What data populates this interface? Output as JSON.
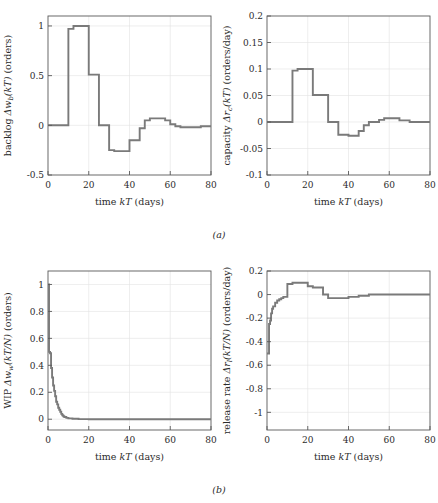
{
  "figure": {
    "captions": [
      {
        "id": "a",
        "text": "(a)"
      },
      {
        "id": "b",
        "text": "(b)"
      }
    ],
    "line_color": "#7a7a7a",
    "axis_color": "#595959",
    "grid_color": "#e2e2e2",
    "background": "#ffffff"
  },
  "chart_data": [
    {
      "id": "backlog",
      "type": "line",
      "drawstyle": "steps-post",
      "position": "top-left",
      "title": "",
      "xlabel": "time kT (days)",
      "xlabel_parts": {
        "pre": "time ",
        "italic": "kT",
        "post": " (days)"
      },
      "ylabel": "backlog Δw_b(kT) (orders)",
      "ylabel_parts": {
        "pre": "backlog ",
        "italic1": "Δw",
        "sub": "b",
        "italic2": "(kT)",
        "post": " (orders)"
      },
      "xlim": [
        0,
        80
      ],
      "ylim": [
        -0.5,
        1.1
      ],
      "xticks": [
        0,
        20,
        40,
        60,
        80
      ],
      "yticks": [
        -0.5,
        0,
        0.5,
        1
      ],
      "ytick_labels": [
        "-0.5",
        "0",
        "0.5",
        "1"
      ],
      "grid": true,
      "legend": null,
      "x": [
        0,
        5,
        10,
        12.5,
        15,
        20,
        22.5,
        25,
        30,
        32.5,
        35,
        40,
        42.5,
        45,
        47.5,
        50,
        55,
        57.5,
        60,
        62.5,
        65,
        70,
        75,
        80
      ],
      "y": [
        0,
        0.0,
        0.97,
        1.0,
        1.0,
        0.51,
        0.51,
        0.0,
        -0.25,
        -0.26,
        -0.26,
        -0.15,
        -0.15,
        -0.03,
        0.05,
        0.07,
        0.07,
        0.05,
        0.01,
        -0.01,
        -0.02,
        -0.02,
        -0.01,
        -0.01
      ]
    },
    {
      "id": "capacity",
      "type": "line",
      "drawstyle": "steps-post",
      "position": "top-right",
      "title": "",
      "xlabel": "time kT (days)",
      "xlabel_parts": {
        "pre": "time ",
        "italic": "kT",
        "post": " (days)"
      },
      "ylabel": "capacity Δr_c(kT) (orders/day)",
      "ylabel_parts": {
        "pre": "capacity ",
        "italic1": "Δr",
        "sub": "c",
        "italic2": "(kT)",
        "post": " (orders/day)"
      },
      "xlim": [
        0,
        80
      ],
      "ylim": [
        -0.1,
        0.2
      ],
      "xticks": [
        0,
        20,
        40,
        60,
        80
      ],
      "yticks": [
        -0.1,
        -0.05,
        0,
        0.05,
        0.1,
        0.15,
        0.2
      ],
      "ytick_labels": [
        "-0.1",
        "-0.05",
        "0",
        "0.05",
        "0.1",
        "0.15",
        "0.2"
      ],
      "grid": true,
      "legend": null,
      "x": [
        0,
        5,
        10,
        12.5,
        15,
        20,
        22.5,
        25,
        30,
        35,
        40,
        42.5,
        45,
        47.5,
        50,
        55,
        57.5,
        60,
        65,
        70,
        75,
        80
      ],
      "y": [
        0,
        0.0,
        0.0,
        0.097,
        0.1,
        0.1,
        0.051,
        0.051,
        0.0,
        -0.024,
        -0.026,
        -0.026,
        -0.017,
        -0.006,
        0.0,
        0.004,
        0.007,
        0.007,
        0.003,
        0.0,
        0.0,
        0.0
      ]
    },
    {
      "id": "wip",
      "type": "line",
      "drawstyle": "steps-post",
      "position": "bottom-left",
      "title": "",
      "xlabel": "time kT (days)",
      "xlabel_parts": {
        "pre": "time ",
        "italic": "kT",
        "post": " (days)"
      },
      "ylabel": "WIP Δw_w(kT/N) (orders)",
      "ylabel_parts": {
        "pre": "WIP ",
        "italic1": "Δw",
        "sub": "w",
        "italic2": "(kT/N)",
        "post": " (orders)"
      },
      "xlim": [
        0,
        80
      ],
      "ylim": [
        -0.08,
        1.1
      ],
      "xticks": [
        0,
        20,
        40,
        60,
        80
      ],
      "yticks": [
        0,
        0.2,
        0.4,
        0.6,
        0.8,
        1
      ],
      "ytick_labels": [
        "0",
        "0.2",
        "0.4",
        "0.6",
        "0.8",
        "1"
      ],
      "grid": true,
      "legend": null,
      "x": [
        0,
        0.5,
        1,
        1.5,
        2,
        2.5,
        3,
        3.5,
        4,
        4.5,
        5,
        5.5,
        6,
        6.5,
        7,
        7.5,
        8,
        9,
        10,
        12,
        15,
        20,
        30,
        40,
        50,
        60,
        70,
        80
      ],
      "y": [
        1.0,
        0.5,
        0.49,
        0.38,
        0.31,
        0.25,
        0.21,
        0.17,
        0.13,
        0.11,
        0.085,
        0.07,
        0.055,
        0.04,
        0.03,
        0.022,
        0.016,
        0.01,
        0.006,
        0.003,
        0.001,
        0.0,
        0.0,
        0.0,
        0.0,
        0.0,
        0.0,
        0.0
      ]
    },
    {
      "id": "release-rate",
      "type": "line",
      "drawstyle": "steps-post",
      "position": "bottom-right",
      "title": "",
      "xlabel": "time kT (days)",
      "xlabel_parts": {
        "pre": "time ",
        "italic": "kT",
        "post": " (days)"
      },
      "ylabel": "release rate Δr_l(kT/N) (orders/day)",
      "ylabel_parts": {
        "pre": "release rate ",
        "italic1": "Δr",
        "sub": "l",
        "italic2": "(kT/N)",
        "post": " (orders/day)"
      },
      "xlim": [
        0,
        80
      ],
      "ylim": [
        -1.15,
        0.2
      ],
      "xticks": [
        0,
        20,
        40,
        60,
        80
      ],
      "yticks": [
        -1,
        -0.8,
        -0.6,
        -0.4,
        -0.2,
        0,
        0.2
      ],
      "ytick_labels": [
        "-1",
        "-0.8",
        "-0.6",
        "-0.4",
        "-0.2",
        "0",
        "0.2"
      ],
      "grid": true,
      "legend": null,
      "x": [
        0,
        0.5,
        1,
        1.5,
        2,
        2.5,
        3,
        4,
        5,
        6,
        7,
        8,
        10,
        12.5,
        15,
        17.5,
        20,
        22.5,
        25,
        27.5,
        30,
        32.5,
        35,
        40,
        42.5,
        45,
        50,
        55,
        60,
        70,
        80
      ],
      "y": [
        -0.5,
        -0.5,
        -0.25,
        -0.22,
        -0.16,
        -0.12,
        -0.1,
        -0.07,
        -0.05,
        -0.04,
        -0.03,
        -0.02,
        0.09,
        0.1,
        0.1,
        0.1,
        0.07,
        0.06,
        0.06,
        0.0,
        -0.03,
        -0.03,
        -0.03,
        -0.02,
        -0.02,
        -0.01,
        0.0,
        0.0,
        0.0,
        0.0,
        0.0
      ]
    }
  ]
}
